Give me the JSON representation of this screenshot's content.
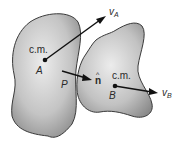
{
  "diagram": {
    "type": "two-body collision",
    "bodies": [
      {
        "name": "A",
        "point_label": "A",
        "cm_label": "c.m.",
        "velocity_label": "v",
        "velocity_subscript": "A"
      },
      {
        "name": "B",
        "point_label": "B",
        "cm_label": "c.m.",
        "velocity_label": "v",
        "velocity_subscript": "B"
      }
    ],
    "contact_point_label": "P",
    "normal_label": "n",
    "normal_hat": "^",
    "colors": {
      "body_fill_light": "#e6e6e6",
      "body_fill_dark": "#8c8c8c",
      "outline": "#3a3a3a",
      "arrow": "#111111"
    }
  }
}
